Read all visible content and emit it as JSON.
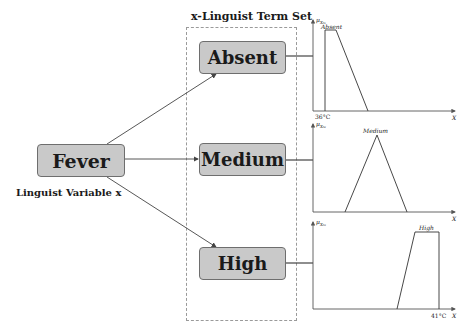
{
  "linguistic_variable": {
    "node_label": "Fever",
    "caption": "Linguist Variable x"
  },
  "term_set": {
    "title": "x-Linguist Term Set",
    "terms": [
      {
        "label": "Absent"
      },
      {
        "label": "Medium"
      },
      {
        "label": "High"
      }
    ]
  },
  "membership_plots": [
    {
      "term": "Absent",
      "y_axis_label": "μX₀₁",
      "x_axis_label": "X",
      "curve_label": "Absent",
      "shape": "left-shoulder trapezoid",
      "x_tick_label": "36°C"
    },
    {
      "term": "Medium",
      "y_axis_label": "μX₀₂",
      "x_axis_label": "X",
      "curve_label": "Medium",
      "shape": "triangle"
    },
    {
      "term": "High",
      "y_axis_label": "μX₀₃",
      "x_axis_label": "X",
      "curve_label": "High",
      "shape": "right-shoulder trapezoid",
      "x_tick_label": "41°C"
    }
  ],
  "colors": {
    "node_fill": "#c9c9c9",
    "node_border": "#6e6e6e",
    "line": "#444444",
    "dashed_box": "#9a9a9a"
  }
}
